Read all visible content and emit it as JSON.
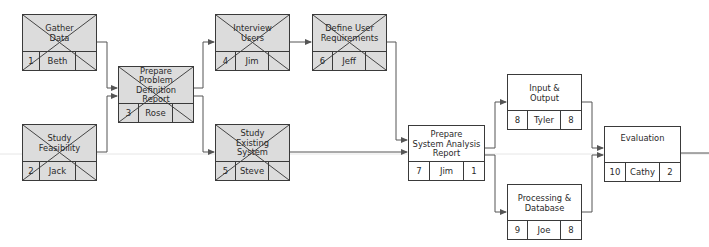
{
  "diagram": {
    "type": "network-diagram",
    "nodes": [
      {
        "id": 1,
        "title": "Gather\nData",
        "owner": "Beth",
        "duration": "",
        "completed": true
      },
      {
        "id": 2,
        "title": "Study\nFeasibility",
        "owner": "Jack",
        "duration": "",
        "completed": true
      },
      {
        "id": 3,
        "title": "Prepare\nProblem Definition\nReport",
        "owner": "Rose",
        "duration": "",
        "completed": true
      },
      {
        "id": 4,
        "title": "Interview\nUsers",
        "owner": "Jim",
        "duration": "",
        "completed": true
      },
      {
        "id": 5,
        "title": "Study\nExisting\nSystem",
        "owner": "Steve",
        "duration": "",
        "completed": true
      },
      {
        "id": 6,
        "title": "Define User\nRequirements",
        "owner": "Jeff",
        "duration": "",
        "completed": true
      },
      {
        "id": 7,
        "title": "Prepare\nSystem Analysis\nReport",
        "owner": "Jim",
        "duration": "1",
        "completed": false
      },
      {
        "id": 8,
        "title": "Input &\nOutput",
        "owner": "Tyler",
        "duration": "8",
        "completed": false
      },
      {
        "id": 9,
        "title": "Processing &\nDatabase",
        "owner": "Joe",
        "duration": "8",
        "completed": false
      },
      {
        "id": 10,
        "title": "Evaluation",
        "owner": "Cathy",
        "duration": "2",
        "completed": false
      }
    ],
    "edges": [
      {
        "from": 1,
        "to": 3
      },
      {
        "from": 2,
        "to": 3
      },
      {
        "from": 3,
        "to": 4
      },
      {
        "from": 3,
        "to": 5
      },
      {
        "from": 4,
        "to": 6
      },
      {
        "from": 6,
        "to": 7
      },
      {
        "from": 5,
        "to": 7
      },
      {
        "from": 7,
        "to": 8
      },
      {
        "from": 7,
        "to": 9
      },
      {
        "from": 8,
        "to": 10
      },
      {
        "from": 9,
        "to": 10
      }
    ]
  },
  "nodes": {
    "n1": {
      "id": "1",
      "title": "Gather\nData",
      "owner": "Beth",
      "duration": ""
    },
    "n2": {
      "id": "2",
      "title": "Study\nFeasibility",
      "owner": "Jack",
      "duration": ""
    },
    "n3": {
      "id": "3",
      "title": "Prepare\nProblem Definition\nReport",
      "owner": "Rose",
      "duration": ""
    },
    "n4": {
      "id": "4",
      "title": "Interview\nUsers",
      "owner": "Jim",
      "duration": ""
    },
    "n5": {
      "id": "5",
      "title": "Study\nExisting\nSystem",
      "owner": "Steve",
      "duration": ""
    },
    "n6": {
      "id": "6",
      "title": "Define User\nRequirements",
      "owner": "Jeff",
      "duration": ""
    },
    "n7": {
      "id": "7",
      "title": "Prepare\nSystem Analysis\nReport",
      "owner": "Jim",
      "duration": "1"
    },
    "n8": {
      "id": "8",
      "title": "Input &\nOutput",
      "owner": "Tyler",
      "duration": "8"
    },
    "n9": {
      "id": "9",
      "title": "Processing &\nDatabase",
      "owner": "Joe",
      "duration": "8"
    },
    "n10": {
      "id": "10",
      "title": "Evaluation",
      "owner": "Cathy",
      "duration": "2"
    }
  },
  "colors": {
    "completed_fill": "#dcdcdc",
    "pending_fill": "#ffffff",
    "line": "#555555",
    "border": "#3a3a3a"
  }
}
